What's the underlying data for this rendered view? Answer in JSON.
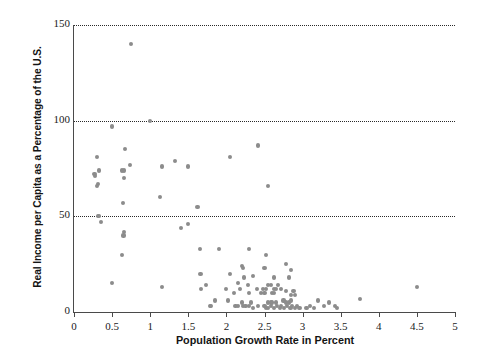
{
  "chart_data": {
    "type": "scatter",
    "title": "",
    "xlabel": "Population Growth Rate in Percent",
    "ylabel": "Real Income per Capita as a Percentage of the U.S.",
    "xlim": [
      0,
      5
    ],
    "ylim": [
      0,
      150
    ],
    "xticks": [
      0,
      0.5,
      1,
      1.5,
      2,
      2.5,
      3,
      3.5,
      4,
      4.5,
      5
    ],
    "xtick_labels": [
      "0",
      "0.5",
      "1",
      "1.5",
      "2",
      "2.5",
      "3",
      "3.5",
      "4",
      "4.5",
      "5"
    ],
    "yticks": [
      0,
      50,
      100,
      150
    ],
    "ytick_labels": [
      "0",
      "50",
      "100",
      "150"
    ],
    "grid": "horizontal-dotted-at-50-100-150",
    "marker_color": "#8c8c8c",
    "marker_size_px": 4.2,
    "point_count": 119,
    "points": [
      [
        0.75,
        140
      ],
      [
        1.0,
        100
      ],
      [
        0.5,
        97
      ],
      [
        2.42,
        87
      ],
      [
        0.67,
        85
      ],
      [
        0.3,
        81
      ],
      [
        2.05,
        81
      ],
      [
        1.33,
        79
      ],
      [
        0.73,
        77
      ],
      [
        1.15,
        76
      ],
      [
        1.5,
        76
      ],
      [
        0.33,
        74
      ],
      [
        0.63,
        74
      ],
      [
        0.66,
        74
      ],
      [
        0.27,
        72
      ],
      [
        0.28,
        71
      ],
      [
        0.66,
        70
      ],
      [
        2.55,
        66
      ],
      [
        0.31,
        67
      ],
      [
        0.3,
        66
      ],
      [
        1.13,
        60
      ],
      [
        0.64,
        57
      ],
      [
        1.62,
        55
      ],
      [
        0.31,
        50
      ],
      [
        0.33,
        50
      ],
      [
        0.35,
        47
      ],
      [
        1.5,
        46
      ],
      [
        1.4,
        44
      ],
      [
        0.66,
        42
      ],
      [
        0.65,
        40
      ],
      [
        1.65,
        33
      ],
      [
        1.9,
        33
      ],
      [
        2.3,
        33
      ],
      [
        2.52,
        30
      ],
      [
        0.63,
        30
      ],
      [
        2.78,
        25
      ],
      [
        2.2,
        24
      ],
      [
        2.22,
        23
      ],
      [
        2.5,
        23
      ],
      [
        2.85,
        22
      ],
      [
        1.66,
        20
      ],
      [
        2.05,
        20
      ],
      [
        2.35,
        19
      ],
      [
        2.23,
        18
      ],
      [
        2.62,
        18
      ],
      [
        2.82,
        18
      ],
      [
        0.5,
        15
      ],
      [
        1.73,
        14
      ],
      [
        2.15,
        15
      ],
      [
        2.28,
        14
      ],
      [
        2.55,
        14
      ],
      [
        2.58,
        14
      ],
      [
        2.68,
        14
      ],
      [
        1.16,
        13
      ],
      [
        1.67,
        12
      ],
      [
        2.0,
        12
      ],
      [
        2.18,
        12
      ],
      [
        2.4,
        12
      ],
      [
        2.48,
        12
      ],
      [
        2.52,
        12
      ],
      [
        2.62,
        12
      ],
      [
        2.65,
        12
      ],
      [
        2.72,
        12
      ],
      [
        2.78,
        11
      ],
      [
        2.88,
        11
      ],
      [
        4.5,
        13
      ],
      [
        2.1,
        10
      ],
      [
        2.3,
        10
      ],
      [
        2.45,
        10
      ],
      [
        2.5,
        10
      ],
      [
        2.6,
        10
      ],
      [
        2.63,
        10
      ],
      [
        2.85,
        9
      ],
      [
        2.9,
        9
      ],
      [
        3.75,
        7
      ],
      [
        1.85,
        6
      ],
      [
        2.02,
        6
      ],
      [
        2.2,
        5
      ],
      [
        2.32,
        5
      ],
      [
        2.55,
        5
      ],
      [
        2.58,
        5
      ],
      [
        2.6,
        5
      ],
      [
        2.65,
        5
      ],
      [
        2.75,
        6
      ],
      [
        2.78,
        5
      ],
      [
        2.82,
        5
      ],
      [
        2.85,
        6
      ],
      [
        3.2,
        6
      ],
      [
        3.35,
        5
      ],
      [
        1.78,
        3
      ],
      [
        1.8,
        3
      ],
      [
        2.12,
        3
      ],
      [
        2.15,
        3
      ],
      [
        2.22,
        3
      ],
      [
        2.25,
        3
      ],
      [
        2.3,
        3
      ],
      [
        2.35,
        2
      ],
      [
        2.42,
        3
      ],
      [
        2.5,
        3
      ],
      [
        2.52,
        2
      ],
      [
        2.55,
        2
      ],
      [
        2.58,
        3
      ],
      [
        2.62,
        2
      ],
      [
        2.66,
        3
      ],
      [
        2.7,
        2
      ],
      [
        2.72,
        3
      ],
      [
        2.76,
        2
      ],
      [
        2.8,
        3
      ],
      [
        2.84,
        2
      ],
      [
        2.86,
        3
      ],
      [
        2.9,
        2
      ],
      [
        2.93,
        3
      ],
      [
        2.96,
        2
      ],
      [
        3.05,
        2
      ],
      [
        3.1,
        3
      ],
      [
        3.15,
        2
      ],
      [
        3.28,
        3
      ],
      [
        3.42,
        3
      ],
      [
        3.45,
        2
      ]
    ]
  }
}
